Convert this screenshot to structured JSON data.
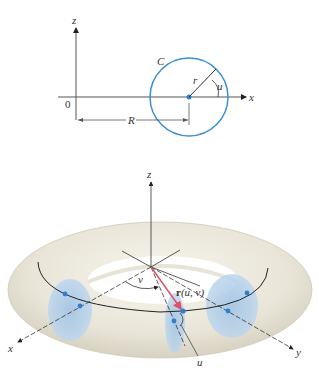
{
  "top_figure": {
    "axis_labels": {
      "z": "z",
      "x": "x",
      "origin": "0"
    },
    "circle_label": "C",
    "radius_label": "r",
    "angle_label": "u",
    "distance_label": "R"
  },
  "bottom_figure": {
    "axis_labels": {
      "z": "z",
      "x": "x",
      "y": "y"
    },
    "angle_v_label": "v",
    "angle_u_label": "u",
    "vector_label_r": "r",
    "vector_label_args": "(u, v)"
  },
  "colors": {
    "circle": "#3d8fd1",
    "torus": "#ede9dc",
    "cross_section": "#a9c9e6",
    "vector": "#e0506a",
    "point": "#2f7fcf"
  }
}
